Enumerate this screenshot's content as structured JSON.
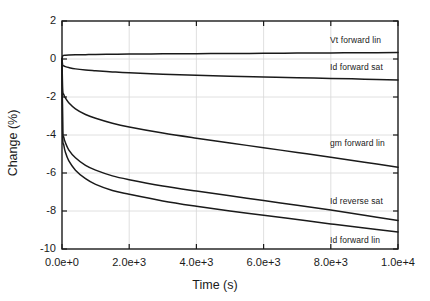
{
  "chart_data": {
    "type": "line",
    "title": "",
    "xlabel": "Time (s)",
    "ylabel": "Change (%)",
    "xlim": [
      0,
      10000
    ],
    "ylim": [
      -10,
      2
    ],
    "grid": true,
    "legend_position": "inline-right-of-curves",
    "xticks": [
      0,
      2000,
      4000,
      6000,
      8000,
      10000
    ],
    "xticklabels": [
      "0.0e+0",
      "2.0e+3",
      "4.0e+3",
      "6.0e+3",
      "8.0e+3",
      "1.0e+4"
    ],
    "yticks": [
      2,
      0,
      -2,
      -4,
      -6,
      -8,
      -10
    ],
    "yticklabels": [
      "2",
      "0",
      "-2",
      "-4",
      "-6",
      "-8",
      "-10"
    ],
    "x": [
      0,
      20,
      50,
      100,
      200,
      400,
      700,
      1000,
      1500,
      2000,
      3000,
      4000,
      5000,
      6000,
      7000,
      8000,
      9000,
      10000
    ],
    "series": [
      {
        "name": "Vt forward lin",
        "color": "#1a1a1a",
        "label_x": 10000,
        "label_y": 0.95,
        "values": [
          0.0,
          0.16,
          0.19,
          0.2,
          0.21,
          0.22,
          0.23,
          0.24,
          0.25,
          0.26,
          0.27,
          0.28,
          0.29,
          0.3,
          0.31,
          0.32,
          0.33,
          0.34
        ]
      },
      {
        "name": "Id forward sat",
        "color": "#1a1a1a",
        "label_x": 10000,
        "label_y": -0.45,
        "values": [
          0.0,
          -0.32,
          -0.36,
          -0.4,
          -0.45,
          -0.52,
          -0.58,
          -0.62,
          -0.68,
          -0.73,
          -0.8,
          -0.86,
          -0.91,
          -0.95,
          -0.99,
          -1.02,
          -1.06,
          -1.1
        ]
      },
      {
        "name": "gm forward lin",
        "color": "#1a1a1a",
        "label_x": 10000,
        "label_y": -4.45,
        "values": [
          0.0,
          -1.6,
          -1.85,
          -2.05,
          -2.3,
          -2.62,
          -2.92,
          -3.12,
          -3.38,
          -3.58,
          -3.9,
          -4.17,
          -4.42,
          -4.67,
          -4.92,
          -5.17,
          -5.43,
          -5.7
        ]
      },
      {
        "name": "Id reverse sat",
        "color": "#1a1a1a",
        "label_x": 10000,
        "label_y": -7.5,
        "values": [
          0.0,
          -3.7,
          -4.1,
          -4.4,
          -4.78,
          -5.2,
          -5.6,
          -5.85,
          -6.15,
          -6.35,
          -6.68,
          -6.95,
          -7.2,
          -7.45,
          -7.7,
          -7.95,
          -8.22,
          -8.5
        ]
      },
      {
        "name": "Id forward lin",
        "color": "#1a1a1a",
        "label_x": 10000,
        "label_y": -9.6,
        "values": [
          0.0,
          -4.0,
          -4.5,
          -4.9,
          -5.35,
          -5.85,
          -6.3,
          -6.6,
          -6.92,
          -7.12,
          -7.47,
          -7.75,
          -8.0,
          -8.22,
          -8.45,
          -8.68,
          -8.9,
          -9.1
        ]
      }
    ]
  },
  "axes": {
    "xlabel": "Time (s)",
    "ylabel": "Change (%)"
  }
}
